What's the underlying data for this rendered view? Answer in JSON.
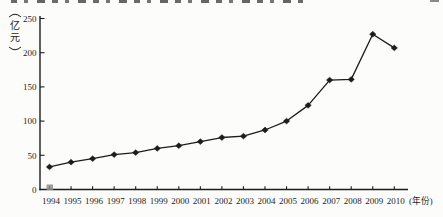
{
  "figure": {
    "background": "#fcfcfb",
    "ink_color": "#1c1c1c",
    "title_clipped_at_top": true,
    "origin_artifact_square_color": "#8c8c8c"
  },
  "chart_data": {
    "type": "line",
    "title": "",
    "x": [
      1994,
      1995,
      1996,
      1997,
      1998,
      1999,
      2000,
      2001,
      2002,
      2003,
      2004,
      2005,
      2006,
      2007,
      2008,
      2009,
      2010
    ],
    "xticklabels": [
      "1994",
      "1995",
      "1996",
      "1997",
      "1998",
      "1999",
      "2000",
      "2001",
      "2002",
      "2003",
      "2004",
      "2005",
      "2006",
      "2007",
      "2008",
      "2009",
      "2010"
    ],
    "values": [
      33,
      40,
      45,
      51,
      54,
      60,
      64,
      70,
      76,
      78,
      87,
      100,
      123,
      160,
      161,
      227,
      207
    ],
    "ylabel": "（亿元）",
    "ylabel_chars": [
      "亿",
      "元"
    ],
    "xlabel": "（年份）",
    "xlabel_chars": [
      "年",
      "份"
    ],
    "yticks": [
      0,
      50,
      100,
      150,
      200,
      250
    ],
    "ylim": [
      0,
      250
    ],
    "grid": false,
    "legend": "none",
    "marker": "filled-diamond",
    "line_color": "#1c1c1c"
  }
}
